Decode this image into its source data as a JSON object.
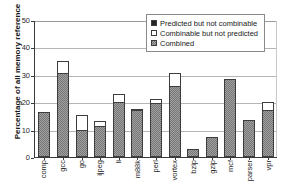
{
  "chart_data": {
    "type": "bar",
    "title": "",
    "subtitle": "",
    "xlabel": "",
    "ylabel": "Percentage of all memory reference",
    "ylim": [
      0,
      50
    ],
    "yticks": [
      0,
      10,
      20,
      30,
      40,
      50
    ],
    "ytick_labels": [
      "0",
      "10",
      "20",
      "30",
      "40",
      "50"
    ],
    "grid": true,
    "stacked": true,
    "legend_position": "top-right",
    "categories": [
      "comp",
      "gcc",
      "go",
      "ijpeg",
      "li",
      "m88k",
      "perl",
      "vortex",
      "bzip",
      "gzip",
      "mcf",
      "parser",
      "vpr"
    ],
    "series": [
      {
        "name": "Combined",
        "color": "#777777",
        "values": [
          16.5,
          30.5,
          10.0,
          11.5,
          20.0,
          17.0,
          19.8,
          25.9,
          3.0,
          7.4,
          28.3,
          13.6,
          17.2
        ]
      },
      {
        "name": "Combinable but not predicted",
        "color": "#ffffff",
        "values": [
          0.0,
          4.6,
          5.2,
          1.8,
          3.1,
          0.5,
          1.2,
          4.6,
          0.0,
          0.0,
          0.0,
          0.0,
          2.8
        ]
      },
      {
        "name": "Predicted but not combinable",
        "color": "#242424",
        "values": [
          0.0,
          0.0,
          0.0,
          0.0,
          0.0,
          0.0,
          0.0,
          0.0,
          0.0,
          0.0,
          0.0,
          0.0,
          0.0
        ]
      }
    ],
    "totals": [
      16.5,
      35.1,
      15.2,
      13.3,
      23.1,
      17.5,
      21.0,
      30.5,
      3.0,
      7.4,
      28.3,
      13.6,
      20.0
    ]
  },
  "legend": {
    "items": [
      {
        "label": "Predicted but not combinable",
        "swatch": "black"
      },
      {
        "label": "Combinable but not predicted",
        "swatch": "white"
      },
      {
        "label": "Combined",
        "swatch": "gray"
      }
    ]
  },
  "axis": {
    "y_title": "Percentage of all memory reference"
  }
}
